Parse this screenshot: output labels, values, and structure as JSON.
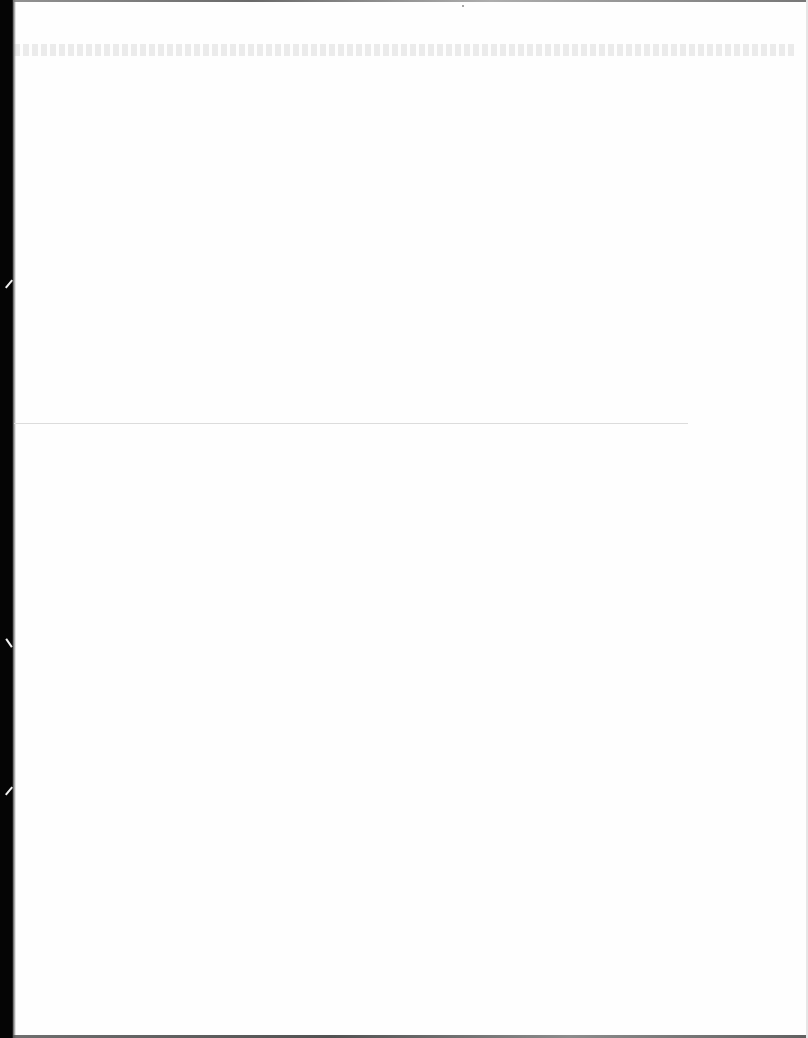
{
  "document": {
    "type": "scanned-page",
    "content_state": "blank",
    "legible_text": [],
    "features": {
      "left_scan_edge": "dark",
      "faint_bleed_through_top": true,
      "horizontal_rule": true
    }
  },
  "colors": {
    "paper": "#fefefe",
    "scan_edge": "#050505",
    "rule": "#dcdcdc"
  }
}
